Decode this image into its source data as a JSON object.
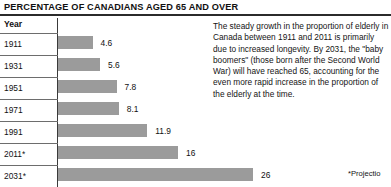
{
  "title": "PERCENTAGE OF CANADIANS AGED 65 AND OVER",
  "axis_header": "Year",
  "note": "The steady growth in the proportion of elderly in Canada between 1911 and 2011 is primarily due to increased longevity. By 2031, the \"baby boomers\" (those born after the Second World War) will have reached 65, accounting for the even more rapid increase in the proportion of the elderly at the time.",
  "footnote": "*Projectio",
  "colors": {
    "bar": "#9b9b9b",
    "axis": "#3a3a3a",
    "rule": "#2b2b2b",
    "separator": "#6d6d6d",
    "text": "#111111",
    "background": "#ffffff"
  },
  "chart_data": {
    "type": "bar",
    "orientation": "horizontal",
    "title": "PERCENTAGE OF CANADIANS AGED 65 AND OVER",
    "xlabel": "",
    "ylabel": "Year",
    "categories": [
      "1911",
      "1931",
      "1951",
      "1971",
      "1991",
      "2011*",
      "2031*"
    ],
    "values": [
      4.6,
      5.6,
      7.8,
      8.1,
      11.9,
      16,
      26
    ],
    "value_labels": [
      "4.6",
      "5.6",
      "7.8",
      "8.1",
      "11.9",
      "16",
      "26"
    ],
    "xlim": [
      0,
      26
    ],
    "grid": false,
    "legend": null,
    "annotations": [
      "*Projectio"
    ]
  }
}
